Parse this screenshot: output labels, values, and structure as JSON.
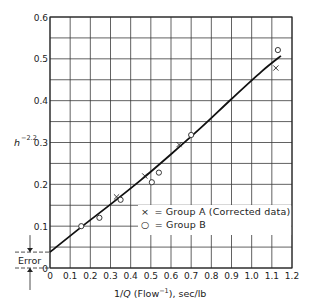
{
  "chart_data": {
    "type": "scatter",
    "title": "",
    "xlabel": "1/Q (Flow⁻¹), sec/lb",
    "xlabel_parts": {
      "prefix": "1/",
      "var": "Q",
      "mid": " (Flow",
      "sup": "−1",
      "suffix": "), sec/lb"
    },
    "ylabel": "h^-2.2",
    "ylabel_parts": {
      "base": "h",
      "sup": "−2.2"
    },
    "xlim": [
      0,
      1.2
    ],
    "ylim": [
      0,
      0.6
    ],
    "x_ticks": [
      "0",
      "0.1",
      "0.2",
      "0.3",
      "0.4",
      "0.5",
      "0.6",
      "0.7",
      "0.8",
      "0.9",
      "1.0",
      "1.1",
      "1.2"
    ],
    "y_ticks": [
      "0",
      "0.1",
      "0.2",
      "0.3",
      "0.4",
      "0.5",
      "0.6"
    ],
    "grid": {
      "x_step": 0.1,
      "y_step": 0.05
    },
    "legend_position": "lower right",
    "series": [
      {
        "name": "Group A (Corrected data)",
        "marker": "x",
        "marker_label": "×",
        "points": [
          [
            0.33,
            0.17
          ],
          [
            0.47,
            0.22
          ],
          [
            0.64,
            0.295
          ],
          [
            1.12,
            0.478
          ]
        ]
      },
      {
        "name": "Group B",
        "marker": "o",
        "marker_label": "○",
        "points": [
          [
            0.155,
            0.1
          ],
          [
            0.245,
            0.12
          ],
          [
            0.35,
            0.163
          ],
          [
            0.505,
            0.205
          ],
          [
            0.54,
            0.228
          ],
          [
            0.7,
            0.318
          ],
          [
            1.13,
            0.521
          ]
        ]
      },
      {
        "name": "Fitted curve",
        "type": "line",
        "points": [
          [
            0,
            0.038
          ],
          [
            0.15,
            0.096
          ],
          [
            0.3,
            0.152
          ],
          [
            0.45,
            0.21
          ],
          [
            0.6,
            0.272
          ],
          [
            0.75,
            0.336
          ],
          [
            0.9,
            0.404
          ],
          [
            1.05,
            0.47
          ],
          [
            1.145,
            0.507
          ]
        ]
      }
    ],
    "annotations": [
      {
        "text": "Error",
        "description": "Intercept offset between y=0 and fitted line at x=0",
        "y_range": [
          0,
          0.038
        ]
      }
    ]
  },
  "legend": {
    "items": [
      {
        "symbol": "×",
        "label": "= Group A (Corrected data)"
      },
      {
        "symbol": "○",
        "label": "= Group B"
      }
    ]
  },
  "annotation": {
    "error_label": "Error"
  }
}
